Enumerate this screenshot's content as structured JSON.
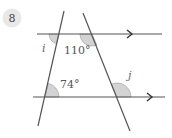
{
  "problem": {
    "number": "8"
  },
  "diagram": {
    "type": "parallel-lines-transversals",
    "parallel_lines": [
      {
        "id": "top",
        "has_arrow": true
      },
      {
        "id": "bottom",
        "has_arrow": true
      }
    ],
    "transversals": [
      "left",
      "right"
    ],
    "angles": [
      {
        "id": "i",
        "label": "i",
        "kind": "unknown"
      },
      {
        "id": "a110",
        "label": "110°",
        "kind": "given"
      },
      {
        "id": "a74",
        "label": "74°",
        "kind": "given"
      },
      {
        "id": "j",
        "label": "j",
        "kind": "unknown"
      }
    ]
  },
  "colors": {
    "line": "#555555",
    "angle_fill": "#d3d3d3",
    "badge_fill": "#e8e8e8"
  }
}
